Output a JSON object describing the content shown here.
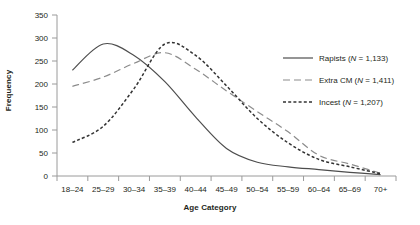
{
  "chart_data": {
    "type": "line",
    "title": "",
    "xlabel": "Age Category",
    "ylabel": "Frequency",
    "categories": [
      "18–24",
      "25–29",
      "30–34",
      "35–39",
      "40–44",
      "45–49",
      "50–54",
      "55–59",
      "60–64",
      "65–69",
      "70+"
    ],
    "ylim": [
      0,
      350
    ],
    "yticks": [
      0,
      50,
      100,
      150,
      200,
      250,
      300,
      350
    ],
    "grid": false,
    "legend_position": "upper right",
    "series": [
      {
        "name": "Rapists",
        "n": "1,133",
        "legend_label": "Rapists (N = 1,133)",
        "style": "solid",
        "color": "#4d4d4d",
        "values": [
          230,
          287,
          262,
          205,
          128,
          60,
          30,
          20,
          14,
          8,
          3
        ]
      },
      {
        "name": "Extra CM",
        "n": "1,411",
        "legend_label": "Extra CM (N = 1,411)",
        "style": "long-dash",
        "color": "#8c8c8c",
        "values": [
          195,
          215,
          245,
          268,
          232,
          185,
          140,
          96,
          45,
          26,
          6
        ]
      },
      {
        "name": "Incest",
        "n": "1,207",
        "legend_label": "Incest (N = 1,207)",
        "style": "short-dash",
        "color": "#333333",
        "values": [
          73,
          108,
          190,
          287,
          262,
          196,
          125,
          72,
          36,
          20,
          5
        ]
      }
    ]
  },
  "axis": {
    "ylabel": "Frequency",
    "xlabel": "Age Category"
  },
  "legend": {
    "items": [
      {
        "label": "Rapists (N = 1,133)",
        "name": "Rapists",
        "n": "1,133"
      },
      {
        "label": "Extra CM (N = 1,411)",
        "name": "Extra CM",
        "n": "1,411"
      },
      {
        "label": "Incest (N = 1,207)",
        "name": "Incest",
        "n": "1,207"
      }
    ]
  },
  "colors": {
    "rapists": "#4d4d4d",
    "extra_cm": "#8c8c8c",
    "incest": "#333333",
    "axis": "#9a9a9a",
    "text": "#231f20"
  }
}
